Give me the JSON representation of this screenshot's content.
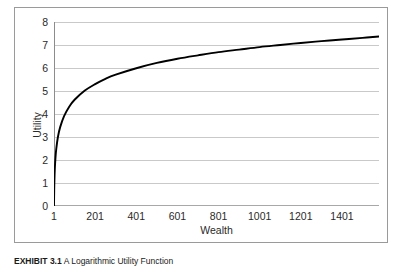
{
  "figure": {
    "caption_label": "EXHIBIT 3.1",
    "caption_text": "A Logarithmic Utility Function"
  },
  "colors": {
    "frame_border": "#9a9a9a",
    "gridline": "#c9c9c9",
    "axis_line": "#8c8c8c",
    "curve": "#000000",
    "text": "#2a2a2a",
    "plot_background": "#ffffff"
  },
  "chart_data": {
    "type": "line",
    "title": "",
    "subtitle": "",
    "xlabel": "Wealth",
    "ylabel": "Utility",
    "xlim": [
      1,
      1581
    ],
    "ylim": [
      0,
      8
    ],
    "grid": true,
    "legend": null,
    "x_ticks": [
      1,
      201,
      401,
      601,
      801,
      1001,
      1201,
      1401
    ],
    "x_tick_labels": [
      "1",
      "201",
      "401",
      "601",
      "801",
      "1001",
      "1201",
      "1401"
    ],
    "y_ticks": [
      0,
      1,
      2,
      3,
      4,
      5,
      6,
      7,
      8
    ],
    "y_tick_labels": [
      "0",
      "1",
      "2",
      "3",
      "4",
      "5",
      "6",
      "7",
      "8"
    ],
    "series": [
      {
        "name": "Utility = ln(Wealth)",
        "x": [
          1,
          2,
          3,
          5,
          8,
          12,
          20,
          31,
          50,
          75,
          101,
          151,
          201,
          251,
          301,
          401,
          501,
          601,
          701,
          801,
          901,
          1001,
          1101,
          1201,
          1301,
          1401,
          1501,
          1581
        ],
        "values": [
          0.0,
          0.69,
          1.1,
          1.61,
          2.08,
          2.48,
          3.0,
          3.43,
          3.91,
          4.32,
          4.62,
          5.02,
          5.3,
          5.53,
          5.71,
          5.99,
          6.22,
          6.4,
          6.55,
          6.69,
          6.8,
          6.91,
          7.0,
          7.09,
          7.17,
          7.24,
          7.31,
          7.37
        ]
      }
    ],
    "annotations": []
  }
}
